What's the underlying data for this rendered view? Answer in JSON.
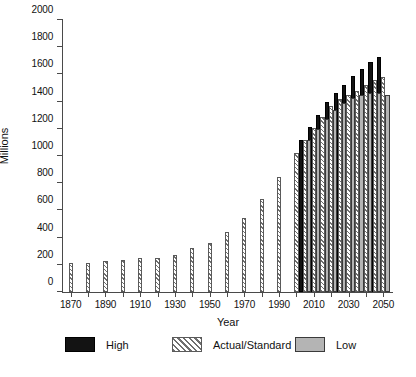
{
  "chart_data": {
    "type": "bar",
    "title": "",
    "xlabel": "Year",
    "ylabel": "Millions",
    "ylim": [
      0,
      2000
    ],
    "xlim": [
      1865,
      2055
    ],
    "ytick_labels": [
      "0",
      "200",
      "400",
      "600",
      "800",
      "1000",
      "1200",
      "1400",
      "1600",
      "1800",
      "2000"
    ],
    "ytick_values": [
      0,
      200,
      400,
      600,
      800,
      1000,
      1200,
      1400,
      1600,
      1800,
      2000
    ],
    "xtick_labels": [
      "1870",
      "1890",
      "1910",
      "1930",
      "1950",
      "1970",
      "1990",
      "2010",
      "2030",
      "2050"
    ],
    "xtick_values": [
      1870,
      1890,
      1910,
      1930,
      1950,
      1970,
      1990,
      2010,
      2030,
      2050
    ],
    "xtick_minor": [
      1880,
      1900,
      1920,
      1940,
      1960,
      1980,
      2000,
      2020,
      2040
    ],
    "grid": false,
    "legend_position": "bottom",
    "series": [
      {
        "name": "High",
        "color": "#131313",
        "x": [
          2005,
          2010,
          2015,
          2020,
          2025,
          2030,
          2035,
          2040,
          2045,
          2050
        ],
        "values": [
          1120,
          1215,
          1300,
          1395,
          1460,
          1525,
          1585,
          1640,
          1690,
          1730
        ]
      },
      {
        "name": "Actual/Standard",
        "color": "#6e6e6e",
        "x": [
          1870,
          1880,
          1890,
          1900,
          1910,
          1920,
          1930,
          1940,
          1950,
          1960,
          1970,
          1980,
          1990,
          2000,
          2005,
          2010,
          2015,
          2020,
          2025,
          2030,
          2035,
          2040,
          2045,
          2050
        ],
        "values": [
          210,
          212,
          228,
          235,
          250,
          250,
          275,
          320,
          360,
          440,
          545,
          685,
          845,
          1025,
          1118,
          1205,
          1290,
          1370,
          1420,
          1450,
          1480,
          1520,
          1560,
          1580
        ]
      },
      {
        "name": "Low",
        "color": "#b4b4b4",
        "x": [
          2005,
          2010,
          2015,
          2020,
          2025,
          2030,
          2035,
          2040,
          2045,
          2050
        ],
        "values": [
          1115,
          1195,
          1270,
          1335,
          1390,
          1425,
          1445,
          1460,
          1465,
          1450
        ]
      }
    ]
  },
  "legend": {
    "items": [
      {
        "label": "High",
        "swatch": "high"
      },
      {
        "label": "Actual/Standard",
        "swatch": "actual"
      },
      {
        "label": "Low",
        "swatch": "low"
      }
    ]
  },
  "caption": {
    "text": ""
  }
}
